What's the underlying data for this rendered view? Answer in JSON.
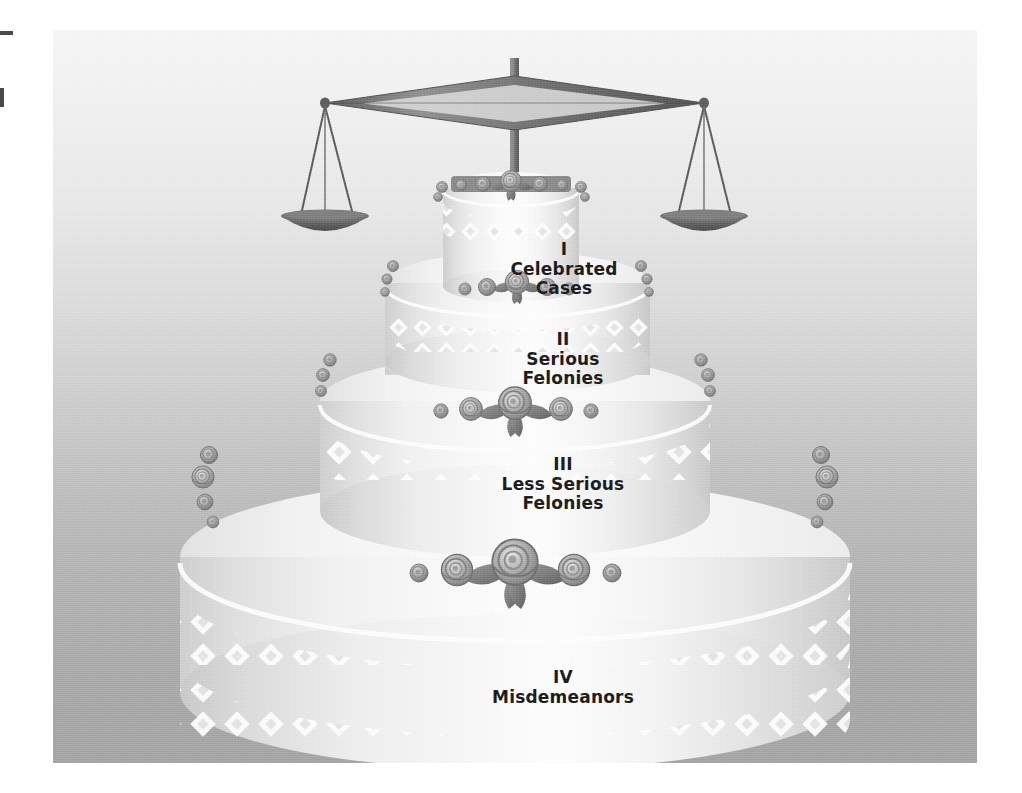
{
  "figure": {
    "type": "diagram",
    "tiers": [
      {
        "numeral": "I",
        "name": "Celebrated Cases",
        "level": 1
      },
      {
        "numeral": "II",
        "name_line1": "Serious",
        "name_line2": "Felonies",
        "level": 2
      },
      {
        "numeral": "III",
        "name_line1": "Less Serious",
        "name_line2": "Felonies",
        "level": 3
      },
      {
        "numeral": "IV",
        "name": "Misdemeanors",
        "level": 4
      }
    ],
    "topper": "scales-of-justice",
    "colors": {
      "background_top": "#f7f7f7",
      "background_bottom": "#a4a4a4",
      "cake_white": "#ffffff",
      "cake_shadow": "#c9c9c9",
      "text": "#141414",
      "metal": "#6e6e6e",
      "flower": "#8e8e8e"
    }
  },
  "tier1": {
    "numeral": "I",
    "line1": "Celebrated",
    "line2": "Cases"
  },
  "tier2": {
    "numeral": "II",
    "line1": "Serious",
    "line2": "Felonies"
  },
  "tier3": {
    "numeral": "III",
    "line1": "Less Serious",
    "line2": "Felonies"
  },
  "tier4": {
    "numeral": "IV",
    "line1": "Misdemeanors",
    "line2": ""
  }
}
